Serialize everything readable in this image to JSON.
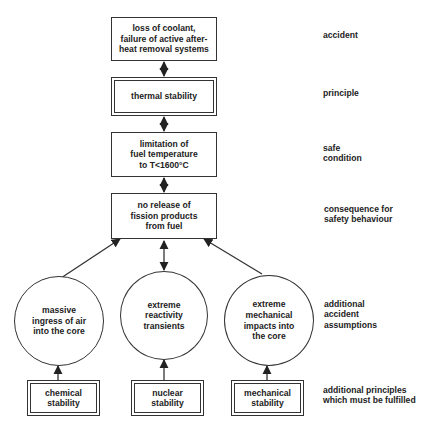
{
  "diagram": {
    "type": "flowchart",
    "nodes": {
      "accident": {
        "text": "loss of coolant,\nfailure of active after-\nheat removal systems",
        "shape": "box"
      },
      "principle": {
        "text": "thermal stability",
        "shape": "double-box"
      },
      "safe_condition": {
        "text": "limitation of\nfuel temperature\nto T<1600°C",
        "shape": "box"
      },
      "consequence": {
        "text": "no release of\nfission products\nfrom fuel",
        "shape": "box"
      },
      "assumption_air": {
        "text": "massive\ningress of air\ninto the core",
        "shape": "circle"
      },
      "assumption_reactivity": {
        "text": "extreme\nreactivity\ntransients",
        "shape": "circle"
      },
      "assumption_mechanical": {
        "text": "extreme\nmechanical\nimpacts into\nthe core",
        "shape": "circle"
      },
      "chemical": {
        "text": "chemical\nstability",
        "shape": "double-box"
      },
      "nuclear": {
        "text": "nuclear\nstability",
        "shape": "double-box"
      },
      "mechanical": {
        "text": "mechanical\nstability",
        "shape": "double-box"
      }
    },
    "edges": [
      {
        "from": "accident",
        "to": "principle",
        "style": "double-arrow"
      },
      {
        "from": "principle",
        "to": "safe_condition",
        "style": "double-arrow"
      },
      {
        "from": "safe_condition",
        "to": "consequence",
        "style": "double-arrow"
      },
      {
        "from": "assumption_air",
        "to": "consequence",
        "style": "arrow"
      },
      {
        "from": "consequence",
        "to": "assumption_reactivity",
        "style": "double-arrow"
      },
      {
        "from": "assumption_mechanical",
        "to": "consequence",
        "style": "arrow"
      },
      {
        "from": "chemical",
        "to": "assumption_air",
        "style": "arrow"
      },
      {
        "from": "nuclear",
        "to": "assumption_reactivity",
        "style": "arrow"
      },
      {
        "from": "mechanical",
        "to": "assumption_mechanical",
        "style": "arrow"
      }
    ],
    "row_labels": {
      "accident": "accident",
      "principle": "principle",
      "safe_condition": "safe\ncondition",
      "consequence": "consequence for\nsafety behaviour",
      "assumptions": "additional\naccident\nassumptions",
      "principles": "additional principles\nwhich must be fulfilled"
    },
    "colors": {
      "line": "#333333",
      "text": "#222222",
      "background": "#ffffff"
    }
  }
}
